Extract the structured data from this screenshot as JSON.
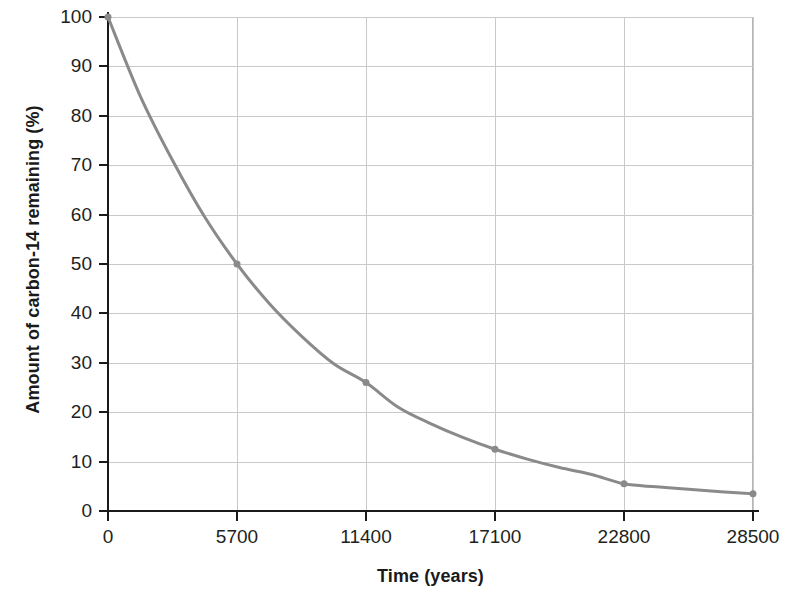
{
  "chart_data": {
    "type": "line",
    "title": "",
    "subtitle": "",
    "xlabel": "Time (years)",
    "ylabel": "Amount of carbon-14 remaining (%)",
    "xlim": [
      0,
      28500
    ],
    "ylim": [
      0,
      100
    ],
    "xticks": [
      0,
      5700,
      11400,
      17100,
      22800,
      28500
    ],
    "xtick_labels": [
      "0",
      "5700",
      "11400",
      "17100",
      "22800",
      "28500"
    ],
    "yticks": [
      0,
      10,
      20,
      30,
      40,
      50,
      60,
      70,
      80,
      90,
      100
    ],
    "ytick_labels": [
      "0",
      "10",
      "20",
      "30",
      "40",
      "50",
      "60",
      "70",
      "80",
      "90",
      "100"
    ],
    "grid": {
      "horizontal": true,
      "vertical": true,
      "color": "#c9c9c9"
    },
    "legend": {
      "show": false,
      "position": "none"
    },
    "annotations": [],
    "series": [
      {
        "name": "Carbon-14 remaining",
        "color": "#8a8a8a",
        "line_width": 3,
        "marker": "circle",
        "marker_size": 6,
        "x": [
          0,
          5700,
          11400,
          17100,
          22800,
          28500
        ],
        "values": [
          100,
          50,
          26,
          12.5,
          5.5,
          3.5
        ],
        "curve_x": [
          0,
          1425,
          2850,
          4275,
          5700,
          7125,
          8550,
          9975,
          11400,
          12825,
          14250,
          15675,
          17100,
          18525,
          19950,
          21375,
          22800,
          24225,
          25650,
          27075,
          28500
        ],
        "curve_y": [
          100,
          84,
          71,
          59.5,
          50,
          42,
          35.4,
          29.8,
          26,
          21,
          17.7,
          14.9,
          12.5,
          10.5,
          8.8,
          7.4,
          5.5,
          4.9,
          4.4,
          3.9,
          3.5
        ]
      }
    ]
  }
}
